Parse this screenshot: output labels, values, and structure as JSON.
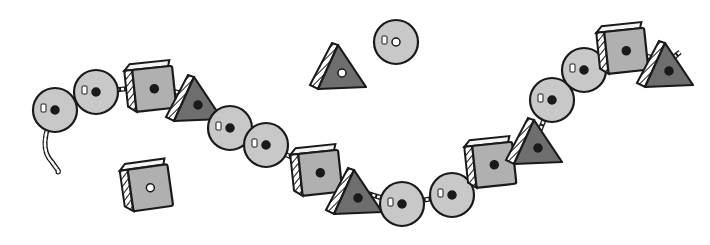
{
  "image": {
    "description": "Black-and-white illustration of a string of lacing beads with three loose beads",
    "colors": {
      "background": "#ffffff",
      "outline": "#1a1a1a",
      "round_bead_fill": "#c8c8c8",
      "square_bead_fill": "#b0b0b0",
      "square_bead_top": "#f4f4f4",
      "triangle_bead_fill": "#6e6e6e",
      "hatch": "#1a1a1a",
      "string": "#ffffff"
    }
  },
  "strung_beads": [
    {
      "shape": "round",
      "x": 55,
      "y": 110
    },
    {
      "shape": "round",
      "x": 96,
      "y": 92
    },
    {
      "shape": "square",
      "x": 152,
      "y": 86
    },
    {
      "shape": "triangle",
      "x": 196,
      "y": 97
    },
    {
      "shape": "round",
      "x": 230,
      "y": 128
    },
    {
      "shape": "round",
      "x": 266,
      "y": 145
    },
    {
      "shape": "square",
      "x": 318,
      "y": 170
    },
    {
      "shape": "triangle",
      "x": 356,
      "y": 190
    },
    {
      "shape": "round",
      "x": 402,
      "y": 204
    },
    {
      "shape": "round",
      "x": 452,
      "y": 195
    },
    {
      "shape": "square",
      "x": 492,
      "y": 162
    },
    {
      "shape": "triangle",
      "x": 536,
      "y": 140
    },
    {
      "shape": "round",
      "x": 552,
      "y": 100
    },
    {
      "shape": "round",
      "x": 584,
      "y": 70
    },
    {
      "shape": "square",
      "x": 624,
      "y": 48
    },
    {
      "shape": "triangle",
      "x": 667,
      "y": 63
    }
  ],
  "loose_beads": [
    {
      "shape": "square",
      "x": 148,
      "y": 185
    },
    {
      "shape": "triangle",
      "x": 340,
      "y": 65
    },
    {
      "shape": "round",
      "x": 396,
      "y": 42
    }
  ]
}
